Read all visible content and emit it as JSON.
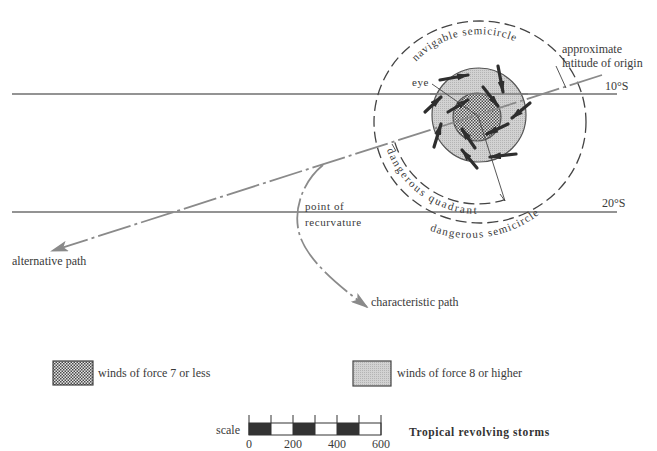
{
  "figure": {
    "title": "Tropical revolving storms"
  },
  "latitudes": {
    "upper": "10°S",
    "lower": "20°S"
  },
  "origin_label": {
    "line1": "approximate",
    "line2": "latitude of origin"
  },
  "storm": {
    "eye_label": "eye",
    "navigable_label": "navigable  semicircle",
    "dangerous_quadrant_label": "dangerous  quadrant",
    "dangerous_semicircle_label": "dangerous  semicircle",
    "wind_arrow_count": 12,
    "rotation": "clockwise"
  },
  "paths": {
    "alternative": "alternative path",
    "characteristic": "characteristic path",
    "recurvature_line1": "point of",
    "recurvature_line2": "recurvature"
  },
  "legend": [
    {
      "label": "winds of force 7 or less",
      "pattern": "dense-stipple"
    },
    {
      "label": "winds of force 8 or higher",
      "pattern": "light-stipple"
    }
  ],
  "scale": {
    "label": "scale",
    "ticks": [
      "0",
      "200",
      "400",
      "600"
    ],
    "segments": 6,
    "segment_value": 100
  },
  "colors": {
    "ink": "#3a3a3a",
    "track_gray": "#8a8a8a",
    "storm_ring": "#c8c8c8",
    "storm_core": "#9a9a9a",
    "scale_fill": "#333333",
    "background": "#ffffff"
  }
}
